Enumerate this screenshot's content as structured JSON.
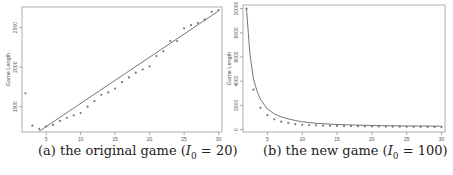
{
  "chart_data": [
    {
      "type": "scatter",
      "title": "",
      "caption": "(a) the original game (I0 = 20)",
      "caption_parts": {
        "prefix": "(a) the original game (",
        "var": "I",
        "sub": "0",
        "suffix": " = 20)"
      },
      "xlabel": "Number of Players",
      "ylabel": "Game Length",
      "xlim": [
        1.5,
        30.5
      ],
      "ylim": [
        1180,
        2760
      ],
      "xticks": [
        5,
        10,
        15,
        20,
        25,
        30
      ],
      "yticks": [
        1500,
        2000,
        2500
      ],
      "grid": false,
      "series": [
        {
          "name": "observed",
          "style": "points",
          "x": [
            2,
            3,
            4,
            5,
            6,
            7,
            8,
            9,
            10,
            11,
            12,
            13,
            14,
            15,
            16,
            17,
            18,
            19,
            20,
            21,
            22,
            23,
            24,
            25,
            26,
            27,
            28,
            29,
            30
          ],
          "values": [
            1670,
            1260,
            1220,
            1250,
            1270,
            1320,
            1360,
            1390,
            1420,
            1500,
            1570,
            1650,
            1680,
            1730,
            1810,
            1870,
            1930,
            1970,
            2010,
            2140,
            2200,
            2330,
            2330,
            2490,
            2530,
            2560,
            2600,
            2700,
            2720
          ]
        },
        {
          "name": "fitted",
          "style": "line",
          "x": [
            4,
            30
          ],
          "values": [
            1190,
            2710
          ]
        }
      ]
    },
    {
      "type": "scatter",
      "title": "",
      "caption": "(b) the new game (I0 = 100)",
      "caption_parts": {
        "prefix": "(b) the new game (",
        "var": "I",
        "sub": "0",
        "suffix": " = 100)"
      },
      "xlabel": "Number of Players",
      "ylabel": "Game Length",
      "xlim": [
        1.5,
        30.5
      ],
      "ylim": [
        -200,
        10300
      ],
      "xticks": [
        5,
        10,
        15,
        20,
        25,
        30
      ],
      "yticks": [
        0,
        2000,
        4000,
        6000,
        8000,
        10000
      ],
      "grid": false,
      "series": [
        {
          "name": "observed",
          "style": "points",
          "x": [
            2,
            3,
            4,
            5,
            6,
            7,
            8,
            9,
            10,
            11,
            12,
            13,
            14,
            15,
            16,
            17,
            18,
            19,
            20,
            21,
            22,
            23,
            24,
            25,
            26,
            27,
            28,
            29,
            30
          ],
          "values": [
            10000,
            3300,
            1800,
            1200,
            850,
            650,
            550,
            450,
            400,
            370,
            350,
            330,
            320,
            310,
            300,
            290,
            280,
            270,
            260,
            255,
            250,
            245,
            240,
            235,
            230,
            225,
            220,
            215,
            210
          ]
        },
        {
          "name": "fitted",
          "style": "line",
          "x": [
            2,
            2.5,
            3,
            3.5,
            4,
            5,
            6,
            7,
            8,
            9,
            10,
            12,
            14,
            16,
            18,
            20,
            22,
            25,
            28,
            30
          ],
          "values": [
            10000,
            6200,
            4200,
            3200,
            2500,
            1700,
            1300,
            1050,
            880,
            750,
            650,
            520,
            450,
            400,
            370,
            340,
            320,
            300,
            290,
            280
          ]
        }
      ]
    }
  ]
}
